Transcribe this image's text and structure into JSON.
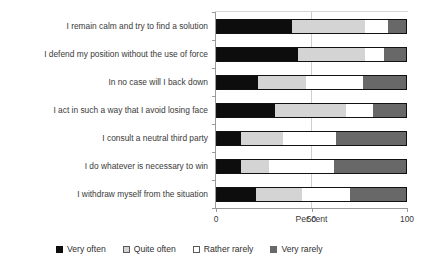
{
  "chart_data": {
    "type": "bar",
    "orientation": "horizontal",
    "stacked": true,
    "stacked_100": true,
    "title": "",
    "xlabel": "Per cent",
    "ylabel": "",
    "xlim": [
      0,
      100
    ],
    "xticks": [
      0,
      50,
      100
    ],
    "xtick_labels": [
      "0",
      "50",
      "100"
    ],
    "grid": "vertical-at-50",
    "legend_position": "bottom",
    "categories": [
      "I remain calm and try to find a solution",
      "I defend my position without the use of force",
      "In no case will I back down",
      "I act in such a way that I avoid losing face",
      "I consult a neutral third party",
      "I do whatever is necessary to win",
      "I withdraw myself from the situation"
    ],
    "series": [
      {
        "name": "Very often",
        "color": "#0d0d0d",
        "values": [
          40,
          43,
          22,
          31,
          13,
          13,
          21
        ]
      },
      {
        "name": "Quite often",
        "color": "#d4d4d4",
        "values": [
          38,
          35,
          25,
          37,
          22,
          15,
          24
        ]
      },
      {
        "name": "Rather rarely",
        "color": "#ffffff",
        "values": [
          12,
          10,
          30,
          14,
          28,
          34,
          25
        ]
      },
      {
        "name": "Very rarely",
        "color": "#686868",
        "values": [
          10,
          12,
          23,
          18,
          37,
          38,
          30
        ]
      }
    ]
  },
  "legend": {
    "items": [
      {
        "label": "Very often"
      },
      {
        "label": "Quite often"
      },
      {
        "label": "Rather rarely"
      },
      {
        "label": "Very rarely"
      }
    ]
  }
}
